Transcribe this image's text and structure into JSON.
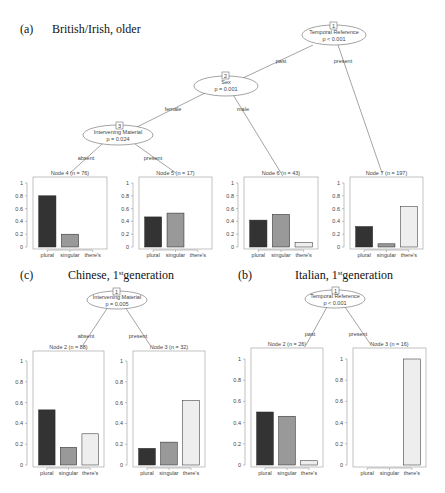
{
  "colors": {
    "plural": "#333333",
    "singular": "#999999",
    "theres": "#eeeeee",
    "axis": "#999999",
    "line": "#666666"
  },
  "panels": [
    {
      "label": "(a)",
      "title": "British/Irish, older",
      "title_sup": "",
      "title_after": ""
    },
    {
      "label": "(c)",
      "title": "Chinese, 1",
      "title_sup": "st",
      "title_after": "generation"
    },
    {
      "label": "(b)",
      "title": "Italian, 1",
      "title_sup": "st",
      "title_after": "generation"
    }
  ],
  "chart_data": [
    {
      "type": "bar",
      "title": "(a) British/Irish, older",
      "tree": {
        "nodes": [
          {
            "id": 1,
            "variable": "Temporal Reference",
            "p": "p < 0.001"
          },
          {
            "id": 2,
            "variable": "Sex",
            "p": "p = 0.001"
          },
          {
            "id": 3,
            "variable": "Intervening Material",
            "p": "p = 0.024"
          }
        ],
        "edges": [
          {
            "from": 1,
            "to": 2,
            "label": "past"
          },
          {
            "from": 1,
            "to": 7,
            "label": "present"
          },
          {
            "from": 2,
            "to": 3,
            "label": "female"
          },
          {
            "from": 2,
            "to": 6,
            "label": "male"
          },
          {
            "from": 3,
            "to": 4,
            "label": "absent"
          },
          {
            "from": 3,
            "to": 5,
            "label": "present"
          }
        ]
      },
      "categories": [
        "plural",
        "singular",
        "there's"
      ],
      "ylim": [
        0,
        1
      ],
      "yticks": [
        "0",
        "0.2",
        "0.4",
        "0.6",
        "0.8",
        "1"
      ],
      "series": [
        {
          "name": "Node 4 (n = 76)",
          "values": [
            0.8,
            0.2,
            0.0
          ]
        },
        {
          "name": "Node 5 (n = 17)",
          "values": [
            0.47,
            0.53,
            0.0
          ]
        },
        {
          "name": "Node 6 (n = 43)",
          "values": [
            0.42,
            0.51,
            0.07
          ]
        },
        {
          "name": "Node 7 (n = 197)",
          "values": [
            0.32,
            0.05,
            0.63
          ]
        }
      ]
    },
    {
      "type": "bar",
      "title": "(c) Chinese, 1st generation",
      "tree": {
        "nodes": [
          {
            "id": 1,
            "variable": "Intervening Material",
            "p": "p = 0.005"
          }
        ],
        "edges": [
          {
            "from": 1,
            "to": 2,
            "label": "absent"
          },
          {
            "from": 1,
            "to": 3,
            "label": "present"
          }
        ]
      },
      "categories": [
        "plural",
        "singular",
        "there's"
      ],
      "ylim": [
        0,
        1
      ],
      "yticks": [
        "0",
        "0.2",
        "0.4",
        "0.6",
        "0.8",
        "1"
      ],
      "series": [
        {
          "name": "Node 2 (n = 88)",
          "values": [
            0.53,
            0.17,
            0.3
          ]
        },
        {
          "name": "Node 3 (n = 32)",
          "values": [
            0.16,
            0.22,
            0.62
          ]
        }
      ]
    },
    {
      "type": "bar",
      "title": "(b) Italian, 1st generation",
      "tree": {
        "nodes": [
          {
            "id": 1,
            "variable": "Temporal Reference",
            "p": "p < 0.001"
          }
        ],
        "edges": [
          {
            "from": 1,
            "to": 2,
            "label": "past"
          },
          {
            "from": 1,
            "to": 3,
            "label": "present"
          }
        ]
      },
      "categories": [
        "plural",
        "singular",
        "there's"
      ],
      "ylim": [
        0,
        1
      ],
      "yticks": [
        "0",
        "0.2",
        "0.4",
        "0.6",
        "0.8",
        "1"
      ],
      "series": [
        {
          "name": "Node 2 (n = 26)",
          "values": [
            0.5,
            0.46,
            0.04
          ]
        },
        {
          "name": "Node 3 (n = 16)",
          "values": [
            0.0,
            0.0,
            1.0
          ]
        }
      ]
    }
  ]
}
